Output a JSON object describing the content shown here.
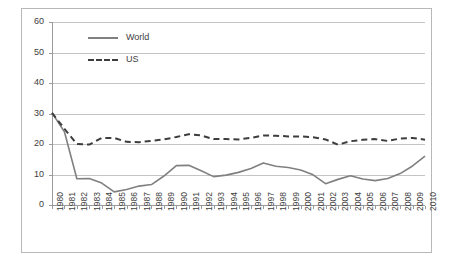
{
  "chart_data": {
    "type": "line",
    "title": "",
    "xlabel": "",
    "ylabel": "",
    "xlim": [
      1980,
      2010
    ],
    "ylim": [
      0,
      60
    ],
    "ytick_values": [
      60,
      50,
      40,
      30,
      20,
      10,
      0
    ],
    "grid": true,
    "legend_position": "top-left-inside",
    "categories": [
      "1980",
      "1981",
      "1982",
      "1983",
      "1984",
      "1985",
      "1986",
      "1987",
      "1988",
      "1989",
      "1990",
      "1991",
      "1992",
      "1993",
      "1994",
      "1995",
      "1996",
      "1997",
      "1998",
      "1999",
      "2000",
      "2001",
      "2002",
      "2003",
      "2004",
      "2005",
      "2006",
      "2007",
      "2008",
      "2009",
      "2010"
    ],
    "series": [
      {
        "name": "World",
        "style": "solid",
        "color": "#808080",
        "values": [
          30.2,
          24.0,
          8.6,
          8.7,
          7.2,
          4.3,
          5.1,
          6.2,
          6.7,
          9.5,
          12.9,
          13.0,
          11.2,
          9.3,
          9.8,
          10.7,
          12.0,
          13.8,
          12.7,
          12.3,
          11.5,
          9.9,
          7.0,
          8.4,
          9.6,
          8.5,
          8.0,
          8.7,
          10.3,
          12.8,
          16.0
        ]
      },
      {
        "name": "US",
        "style": "dashed",
        "color": "#3d3d3d",
        "values": [
          30.2,
          25.0,
          20.0,
          19.8,
          22.0,
          22.0,
          20.7,
          20.6,
          21.0,
          21.5,
          22.3,
          23.2,
          22.8,
          21.6,
          21.6,
          21.5,
          22.0,
          22.8,
          22.7,
          22.5,
          22.5,
          22.2,
          21.5,
          19.8,
          20.9,
          21.4,
          21.6,
          21.0,
          21.8,
          22.0,
          21.4
        ]
      }
    ]
  },
  "legend": {
    "entries": [
      {
        "label": "World",
        "style": "solid"
      },
      {
        "label": "US",
        "style": "dashed"
      }
    ]
  }
}
